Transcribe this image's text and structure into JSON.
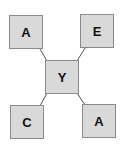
{
  "diagram": {
    "center": {
      "label": "Y"
    },
    "nodes": [
      {
        "position": "top-left",
        "label": "A"
      },
      {
        "position": "top-right",
        "label": "E"
      },
      {
        "position": "bottom-left",
        "label": "C"
      },
      {
        "position": "bottom-right",
        "label": "A"
      }
    ],
    "colors": {
      "box_fill": "#d9d9d9",
      "box_border": "#8a8a8a",
      "line": "#555555"
    }
  }
}
